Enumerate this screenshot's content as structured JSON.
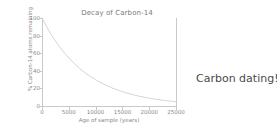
{
  "caption": {
    "text": "Carbon dating!"
  },
  "colors": {
    "background": "#ffffff",
    "curve": "#cfcfcf",
    "axis": "#c9c9c9",
    "tick_text": "#8a8a8a",
    "title_text": "#7a7a7a",
    "caption_text": "#4a4a4a"
  },
  "chart_data": {
    "type": "line",
    "title": "Decay of Carbon-14",
    "xlabel": "Age of sample (years)",
    "ylabel": "% Carbon-14 atoms remaining",
    "xlim": [
      0,
      25000
    ],
    "ylim": [
      0,
      100
    ],
    "xticks": [
      0,
      5000,
      10000,
      15000,
      20000,
      25000
    ],
    "xtick_labels": [
      "0",
      "5000",
      "10000",
      "15000",
      "20000",
      "25000"
    ],
    "yticks": [
      0,
      20,
      40,
      60,
      80,
      100
    ],
    "ytick_labels": [
      "0",
      "20",
      "40",
      "60",
      "80",
      "100"
    ],
    "grid": false,
    "legend": null,
    "series": [
      {
        "name": "Carbon-14 remaining",
        "x": [
          0,
          1000,
          2000,
          3000,
          4000,
          5000,
          5730,
          6000,
          7000,
          8000,
          9000,
          10000,
          11460,
          12000,
          13000,
          14000,
          15000,
          16000,
          17190,
          18000,
          19000,
          20000,
          21000,
          22000,
          22920,
          23000,
          24000,
          25000
        ],
        "values": [
          100.0,
          88.6,
          78.5,
          69.6,
          61.6,
          54.6,
          50.0,
          48.4,
          42.8,
          37.9,
          33.6,
          29.8,
          25.0,
          23.4,
          20.7,
          18.4,
          16.3,
          14.4,
          12.5,
          11.3,
          10.0,
          8.9,
          7.9,
          7.0,
          6.25,
          6.2,
          5.5,
          4.9
        ]
      }
    ]
  }
}
